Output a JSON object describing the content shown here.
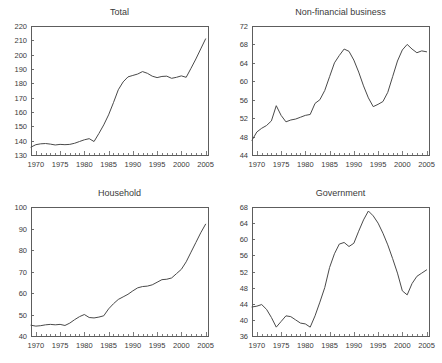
{
  "figure": {
    "background": "#ffffff",
    "line_color": "#4a4a4a",
    "axis_color": "#5d5d5d"
  },
  "chart_data": [
    {
      "type": "line",
      "title": "Total",
      "panel": "top-left",
      "xlabel": "",
      "ylabel": "",
      "xlim": [
        1969,
        2005.5
      ],
      "ylim": [
        130,
        220
      ],
      "ytick_step": 10,
      "yticks": [
        130,
        140,
        150,
        160,
        170,
        180,
        190,
        200,
        210,
        220
      ],
      "xticks": [
        1970,
        1975,
        1980,
        1985,
        1990,
        1995,
        2000,
        2005
      ],
      "xtick_minor_step": 1,
      "grid": false,
      "legend": "none",
      "x": [
        1969,
        1970,
        1971,
        1972,
        1973,
        1974,
        1975,
        1976,
        1977,
        1978,
        1979,
        1980,
        1981,
        1982,
        1983,
        1984,
        1985,
        1986,
        1987,
        1988,
        1989,
        1990,
        1991,
        1992,
        1993,
        1994,
        1995,
        1996,
        1997,
        1998,
        1999,
        2000,
        2001,
        2002,
        2003,
        2004,
        2005
      ],
      "values": [
        135.5,
        137.2,
        137.8,
        138.0,
        137.6,
        137.0,
        137.4,
        137.2,
        137.4,
        138.2,
        139.4,
        140.6,
        141.4,
        139.4,
        145.0,
        151.0,
        158.0,
        166.5,
        175.5,
        181.0,
        184.5,
        185.5,
        186.5,
        188.2,
        187.0,
        185.0,
        184.0,
        184.8,
        185.0,
        183.5,
        184.2,
        185.2,
        184.2,
        190.5,
        197.0,
        204.0,
        211.0
      ]
    },
    {
      "type": "line",
      "title": "Non-financial business",
      "panel": "top-right",
      "xlabel": "",
      "ylabel": "",
      "xlim": [
        1969,
        2005.5
      ],
      "ylim": [
        44,
        72
      ],
      "ytick_step": 4,
      "yticks": [
        44,
        48,
        52,
        56,
        60,
        64,
        68,
        72
      ],
      "xticks": [
        1970,
        1975,
        1980,
        1985,
        1990,
        1995,
        2000,
        2005
      ],
      "xtick_minor_step": 1,
      "grid": false,
      "legend": "none",
      "x": [
        1969,
        1970,
        1971,
        1972,
        1973,
        1974,
        1975,
        1976,
        1977,
        1978,
        1979,
        1980,
        1981,
        1982,
        1983,
        1984,
        1985,
        1986,
        1987,
        1988,
        1989,
        1990,
        1991,
        1992,
        1993,
        1994,
        1995,
        1996,
        1997,
        1998,
        1999,
        2000,
        2001,
        2002,
        2003,
        2004,
        2005
      ],
      "values": [
        47.2,
        49.0,
        49.8,
        50.4,
        51.4,
        54.7,
        52.6,
        51.2,
        51.6,
        51.8,
        52.2,
        52.6,
        52.8,
        55.2,
        56.0,
        58.0,
        61.0,
        64.0,
        65.6,
        67.0,
        66.5,
        64.6,
        62.0,
        59.0,
        56.4,
        54.5,
        55.0,
        55.6,
        57.6,
        61.0,
        64.4,
        66.8,
        68.0,
        67.0,
        66.2,
        66.6,
        66.4
      ]
    },
    {
      "type": "line",
      "title": "Household",
      "panel": "bottom-left",
      "xlabel": "",
      "ylabel": "",
      "xlim": [
        1969,
        2005.5
      ],
      "ylim": [
        40,
        100
      ],
      "ytick_step": 10,
      "yticks": [
        40,
        50,
        60,
        70,
        80,
        90,
        100
      ],
      "xticks": [
        1970,
        1975,
        1980,
        1985,
        1990,
        1995,
        2000,
        2005
      ],
      "xtick_minor_step": 1,
      "grid": false,
      "legend": "none",
      "x": [
        1969,
        1970,
        1971,
        1972,
        1973,
        1974,
        1975,
        1976,
        1977,
        1978,
        1979,
        1980,
        1981,
        1982,
        1983,
        1984,
        1985,
        1986,
        1987,
        1988,
        1989,
        1990,
        1991,
        1992,
        1993,
        1994,
        1995,
        1996,
        1997,
        1998,
        1999,
        2000,
        2001,
        2002,
        2003,
        2004,
        2005
      ],
      "values": [
        45.0,
        44.6,
        44.8,
        45.2,
        45.4,
        45.2,
        45.4,
        44.9,
        46.0,
        47.6,
        49.0,
        50.0,
        48.6,
        48.4,
        48.8,
        49.4,
        52.6,
        55.0,
        57.0,
        58.2,
        59.4,
        61.0,
        62.4,
        63.0,
        63.2,
        63.8,
        65.0,
        66.2,
        66.4,
        67.0,
        69.0,
        71.0,
        74.5,
        79.0,
        83.5,
        88.0,
        92.0
      ]
    },
    {
      "type": "line",
      "title": "Government",
      "panel": "bottom-right",
      "xlabel": "",
      "ylabel": "",
      "xlim": [
        1969,
        2005.5
      ],
      "ylim": [
        36,
        68
      ],
      "ytick_step": 4,
      "yticks": [
        36,
        40,
        44,
        48,
        52,
        56,
        60,
        64,
        68
      ],
      "xticks": [
        1970,
        1975,
        1980,
        1985,
        1990,
        1995,
        2000,
        2005
      ],
      "xtick_minor_step": 1,
      "grid": false,
      "legend": "none",
      "x": [
        1969,
        1970,
        1971,
        1972,
        1973,
        1974,
        1975,
        1976,
        1977,
        1978,
        1979,
        1980,
        1981,
        1982,
        1983,
        1984,
        1985,
        1986,
        1987,
        1988,
        1989,
        1990,
        1991,
        1992,
        1993,
        1994,
        1995,
        1996,
        1997,
        1998,
        1999,
        2000,
        2001,
        2002,
        2003,
        2004,
        2005
      ],
      "values": [
        43.2,
        43.4,
        43.8,
        42.6,
        40.6,
        38.2,
        39.6,
        41.0,
        40.8,
        40.0,
        39.2,
        39.0,
        38.2,
        41.0,
        44.4,
        48.0,
        53.0,
        56.4,
        58.8,
        59.2,
        58.2,
        59.0,
        62.0,
        64.8,
        67.0,
        65.8,
        64.0,
        61.5,
        58.6,
        55.2,
        51.6,
        47.2,
        46.2,
        49.0,
        50.8,
        51.6,
        52.4
      ]
    }
  ]
}
